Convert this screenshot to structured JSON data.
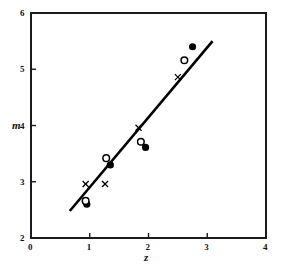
{
  "chart_data": {
    "type": "scatter",
    "title": "",
    "xlabel": "z",
    "ylabel": "m",
    "xlim": [
      0,
      4
    ],
    "ylim": [
      2,
      6
    ],
    "xticks": [
      "0",
      "1",
      "2",
      "3",
      "4"
    ],
    "xtick_values": [
      0,
      1,
      2,
      3,
      4
    ],
    "yticks": [
      "2",
      "3",
      "4",
      "5",
      "6"
    ],
    "ytick_values": [
      2,
      3,
      4,
      5,
      6
    ],
    "grid": false,
    "legend": "none",
    "frame": "box",
    "series": [
      {
        "name": "filled-circle",
        "marker": "filled-circle",
        "color": "#000000",
        "points": [
          {
            "x": 0.95,
            "y": 2.6
          },
          {
            "x": 1.35,
            "y": 3.3
          },
          {
            "x": 1.95,
            "y": 3.61
          },
          {
            "x": 2.75,
            "y": 5.4
          }
        ]
      },
      {
        "name": "open-circle",
        "marker": "open-circle",
        "color": "#000000",
        "points": [
          {
            "x": 0.93,
            "y": 2.66
          },
          {
            "x": 1.28,
            "y": 3.42
          },
          {
            "x": 1.87,
            "y": 3.71
          },
          {
            "x": 2.61,
            "y": 5.16
          }
        ]
      },
      {
        "name": "cross",
        "marker": "x",
        "color": "#000000",
        "points": [
          {
            "x": 0.93,
            "y": 2.96
          },
          {
            "x": 1.26,
            "y": 2.96
          },
          {
            "x": 1.83,
            "y": 3.96
          },
          {
            "x": 2.5,
            "y": 4.86
          }
        ]
      }
    ],
    "fit_line": {
      "name": "regression-line",
      "color": "#000000",
      "x_start": 0.66,
      "y_start": 2.48,
      "x_end": 3.09,
      "y_end": 5.5
    }
  },
  "axes": {
    "x_axis_label": "z",
    "y_axis_label": "m"
  }
}
